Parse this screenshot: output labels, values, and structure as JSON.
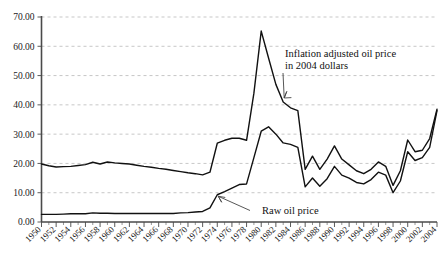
{
  "chart_data": {
    "type": "line",
    "title": "",
    "subtitle": "",
    "xlabel": "",
    "ylabel": "",
    "xlim": [
      1950,
      2004
    ],
    "ylim": [
      0,
      70
    ],
    "grid": true,
    "legend_position": "inline-annotations",
    "y_ticks": [
      "0.00",
      "10.00",
      "20.00",
      "30.00",
      "40.00",
      "50.00",
      "60.00",
      "70.00"
    ],
    "y_tick_values": [
      0,
      10,
      20,
      30,
      40,
      50,
      60,
      70
    ],
    "x_ticks": [
      "1950",
      "1952",
      "1954",
      "1956",
      "1958",
      "1960",
      "1962",
      "1964",
      "1966",
      "1968",
      "1970",
      "1972",
      "1974",
      "1976",
      "1978",
      "1980",
      "1982",
      "1984",
      "1986",
      "1988",
      "1990",
      "1992",
      "1994",
      "1996",
      "1998",
      "2000",
      "2002",
      "2004"
    ],
    "x": [
      1950,
      1951,
      1952,
      1953,
      1954,
      1955,
      1956,
      1957,
      1958,
      1959,
      1960,
      1961,
      1962,
      1963,
      1964,
      1965,
      1966,
      1967,
      1968,
      1969,
      1970,
      1971,
      1972,
      1973,
      1974,
      1975,
      1976,
      1977,
      1978,
      1979,
      1980,
      1981,
      1982,
      1983,
      1984,
      1985,
      1986,
      1987,
      1988,
      1989,
      1990,
      1991,
      1992,
      1993,
      1994,
      1995,
      1996,
      1997,
      1998,
      1999,
      2000,
      2001,
      2002,
      2003,
      2004
    ],
    "series": [
      {
        "name": "Inflation adjusted oil price in 2004 dollars",
        "color": "#111111",
        "values": [
          19.8,
          19.2,
          18.8,
          18.9,
          19.0,
          19.3,
          19.6,
          20.4,
          19.8,
          20.5,
          20.2,
          20.0,
          19.8,
          19.4,
          19.0,
          18.7,
          18.3,
          18.0,
          17.6,
          17.2,
          16.8,
          16.5,
          16.1,
          17.0,
          26.9,
          27.9,
          28.6,
          28.6,
          27.9,
          44.0,
          65.2,
          56.0,
          47.0,
          41.0,
          39.0,
          38.0,
          18.0,
          22.5,
          18.0,
          21.5,
          26.0,
          21.5,
          19.5,
          17.5,
          16.5,
          18.0,
          20.5,
          19.0,
          12.5,
          17.5,
          28.0,
          24.0,
          24.5,
          28.5,
          38.5
        ]
      },
      {
        "name": "Raw oil price",
        "color": "#111111",
        "values": [
          2.6,
          2.6,
          2.6,
          2.7,
          2.8,
          2.8,
          2.8,
          3.1,
          3.0,
          3.0,
          2.9,
          2.9,
          2.9,
          2.9,
          2.9,
          2.9,
          2.9,
          2.9,
          2.9,
          3.1,
          3.2,
          3.4,
          3.6,
          4.8,
          9.3,
          10.4,
          11.6,
          12.8,
          13.0,
          22.0,
          31.0,
          32.5,
          30.0,
          27.0,
          26.5,
          25.5,
          12.0,
          15.0,
          12.2,
          14.8,
          19.0,
          16.0,
          15.0,
          13.5,
          13.0,
          14.5,
          17.0,
          16.0,
          10.0,
          14.0,
          24.0,
          21.0,
          22.0,
          25.5,
          38.0
        ]
      }
    ],
    "annotations": [
      {
        "id": "inflation-adjusted-label",
        "line1": "Inflation adjusted oil price",
        "line2": "in 2004 dollars",
        "points_to_year": 1983,
        "points_to_value": 42
      },
      {
        "id": "raw-oil-price-label",
        "line1": "Raw oil price",
        "line2": "",
        "points_to_year": 1974,
        "points_to_value": 9.3
      }
    ]
  }
}
